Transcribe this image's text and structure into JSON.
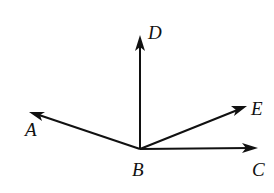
{
  "diagram": {
    "type": "geometry-rays",
    "vertex": {
      "name": "B",
      "label": "B",
      "x": 140,
      "y": 149
    },
    "rays": [
      {
        "name": "BD",
        "end_label": "D",
        "tip": {
          "x": 140,
          "y": 37
        }
      },
      {
        "name": "BA",
        "end_label": "A",
        "tip": {
          "x": 29,
          "y": 112
        }
      },
      {
        "name": "BE",
        "end_label": "E",
        "tip": {
          "x": 247,
          "y": 106
        }
      },
      {
        "name": "BC",
        "end_label": "C",
        "tip": {
          "x": 257,
          "y": 148
        }
      }
    ],
    "labels": {
      "A": "A",
      "B": "B",
      "C": "C",
      "D": "D",
      "E": "E"
    },
    "colors": {
      "stroke": "#111111",
      "background": "#ffffff"
    }
  }
}
